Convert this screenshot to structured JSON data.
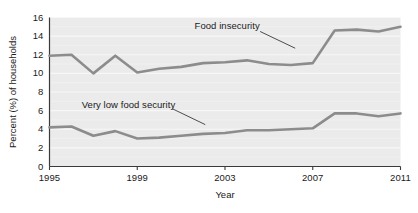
{
  "chart_data": {
    "type": "line",
    "title": "",
    "xlabel": "Year",
    "ylabel": "Percent (%) of households",
    "xlim": [
      1995,
      2011
    ],
    "ylim": [
      0,
      16
    ],
    "xticks": [
      "1995",
      "1999",
      "2003",
      "2007",
      "2011"
    ],
    "xtick_values": [
      1995,
      1999,
      2003,
      2007,
      2011
    ],
    "yticks": [
      "0",
      "2",
      "4",
      "6",
      "8",
      "10",
      "12",
      "14",
      "16"
    ],
    "ytick_values": [
      0,
      2,
      4,
      6,
      8,
      10,
      12,
      14,
      16
    ],
    "grid": true,
    "grid_axis": "y",
    "legend_position": "inline-annotations",
    "x": [
      1995,
      1996,
      1997,
      1998,
      1999,
      2000,
      2001,
      2002,
      2003,
      2004,
      2005,
      2006,
      2007,
      2008,
      2009,
      2010,
      2011
    ],
    "series": [
      {
        "name": "Food insecurity",
        "color": "#8c8c8c",
        "values": [
          11.9,
          12.0,
          10.0,
          11.9,
          10.1,
          10.5,
          10.7,
          11.1,
          11.2,
          11.4,
          11.0,
          10.9,
          11.1,
          14.6,
          14.7,
          14.5,
          15.0
        ],
        "label_x": 2003.1,
        "label_y": 15.1
      },
      {
        "name": "Very low food security",
        "color": "#8c8c8c",
        "values": [
          4.2,
          4.3,
          3.3,
          3.8,
          3.0,
          3.1,
          3.3,
          3.5,
          3.6,
          3.9,
          3.9,
          4.0,
          4.1,
          5.7,
          5.7,
          5.4,
          5.7
        ],
        "label_x": 1998.6,
        "label_y": 6.6
      }
    ],
    "annotations": [
      {
        "text": "Food insecurity",
        "leader_from_x": 2004.6,
        "leader_from_y": 14.5,
        "leader_to_x": 2006.2,
        "leader_to_y": 12.7
      },
      {
        "text": "Very low food security",
        "leader_from_x": 2000.6,
        "leader_from_y": 6.2,
        "leader_to_x": 2002.1,
        "leader_to_y": 4.5
      }
    ]
  },
  "style": {
    "plot_background": "#ebebeb",
    "grid_color": "#f7f7f7",
    "axis_color": "#3a3a3a",
    "line_color": "#8c8c8c",
    "text_color": "#1a1a1a"
  }
}
